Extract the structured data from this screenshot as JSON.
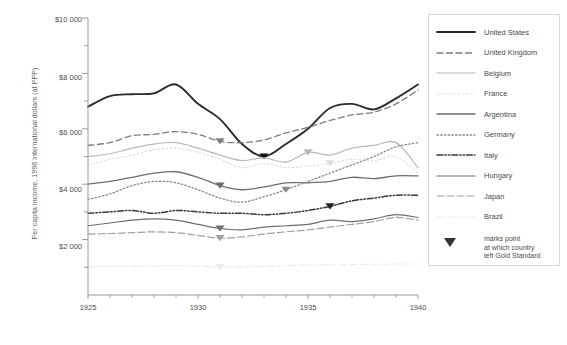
{
  "chart_data": {
    "type": "line",
    "title": "",
    "xlabel": "",
    "ylabel": "Per capita income, 1996 international dollars (at PPP)",
    "xlim": [
      1925,
      1940
    ],
    "ylim": [
      0,
      10000
    ],
    "xticks": [
      "1925",
      "1930",
      "1935",
      "1940"
    ],
    "xtick_values": [
      1925,
      1930,
      1935,
      1940
    ],
    "x_minor_step": 1,
    "yticks": [
      "$2 000",
      "$4 000",
      "$6 000",
      "$8 000",
      "$10 000"
    ],
    "ytick_values": [
      2000,
      4000,
      6000,
      8000,
      10000
    ],
    "y_minor_step": 1000,
    "grid": false,
    "legend_position": "right-outside",
    "x": [
      1925,
      1926,
      1927,
      1928,
      1929,
      1930,
      1931,
      1932,
      1933,
      1934,
      1935,
      1936,
      1937,
      1938,
      1939,
      1940
    ],
    "series": [
      {
        "name": "United States",
        "style": "solid",
        "color": "#2b2b2b",
        "width": 1.9,
        "gold_standard_exit_year": 1933,
        "values": [
          6800,
          7180,
          7250,
          7280,
          7600,
          6900,
          6350,
          5450,
          5000,
          5450,
          6000,
          6750,
          6900,
          6700,
          7100,
          7600
        ]
      },
      {
        "name": "United Kingdom",
        "style": "dashed",
        "color": "#7d7d7d",
        "width": 1.3,
        "gold_standard_exit_year": 1931,
        "values": [
          5400,
          5500,
          5750,
          5800,
          5900,
          5800,
          5550,
          5500,
          5600,
          5850,
          6050,
          6300,
          6500,
          6600,
          6900,
          7400
        ]
      },
      {
        "name": "Belgium",
        "style": "solid",
        "color": "#b9b9b9",
        "width": 1.2,
        "gold_standard_exit_year": 1935,
        "values": [
          5000,
          5100,
          5300,
          5450,
          5500,
          5300,
          5050,
          4850,
          4950,
          4800,
          5150,
          5050,
          5300,
          5400,
          5500,
          4600
        ]
      },
      {
        "name": "France",
        "style": "dotted",
        "color": "#dcdcdc",
        "width": 1.1,
        "gold_standard_exit_year": 1936,
        "values": [
          4700,
          4900,
          5050,
          5250,
          5300,
          5150,
          4900,
          4600,
          4750,
          4600,
          4650,
          4750,
          4900,
          4850,
          5000,
          4400
        ]
      },
      {
        "name": "Argentina",
        "style": "solid",
        "color": "#6e6e6e",
        "width": 1.3,
        "gold_standard_exit_year": 1931,
        "values": [
          4000,
          4100,
          4250,
          4400,
          4450,
          4250,
          3950,
          3800,
          3900,
          4050,
          4050,
          4100,
          4250,
          4200,
          4300,
          4300
        ]
      },
      {
        "name": "Germany",
        "style": "dotted-dense",
        "color": "#8a8a8a",
        "width": 1.3,
        "gold_standard_exit_year": 1934,
        "values": [
          3450,
          3650,
          3950,
          4100,
          4050,
          3800,
          3500,
          3350,
          3550,
          3800,
          4100,
          4400,
          4700,
          5000,
          5350,
          5500
        ]
      },
      {
        "name": "Italy",
        "style": "dash-dot-dot",
        "color": "#3a3a3a",
        "width": 1.5,
        "gold_standard_exit_year": 1936,
        "values": [
          2950,
          3000,
          3050,
          2950,
          3050,
          3000,
          2950,
          2950,
          2900,
          2950,
          3050,
          3200,
          3400,
          3500,
          3600,
          3600
        ]
      },
      {
        "name": "Hungary",
        "style": "solid",
        "color": "#6e6e6e",
        "width": 1.2,
        "gold_standard_exit_year": 1931,
        "values": [
          2500,
          2600,
          2700,
          2750,
          2700,
          2550,
          2400,
          2350,
          2450,
          2500,
          2550,
          2700,
          2650,
          2750,
          2900,
          2800
        ]
      },
      {
        "name": "Japan",
        "style": "long-dash",
        "color": "#a0a0a0",
        "width": 1.2,
        "gold_standard_exit_year": 1931,
        "values": [
          2200,
          2220,
          2250,
          2280,
          2250,
          2150,
          2050,
          2100,
          2200,
          2280,
          2350,
          2450,
          2550,
          2650,
          2800,
          2700
        ]
      },
      {
        "name": "Brazil",
        "style": "long-dash-faint",
        "color": "#ececec",
        "width": 1.1,
        "gold_standard_exit_year": 1931,
        "values": [
          1020,
          1030,
          1040,
          1050,
          1060,
          1040,
          1010,
          1020,
          1040,
          1060,
          1080,
          1090,
          1100,
          1110,
          1120,
          1120
        ]
      }
    ],
    "marker_note": {
      "glyph": "▼",
      "lines": [
        "marks point",
        "at which country",
        "left Gold Standard"
      ]
    }
  },
  "legend": {
    "items": [
      {
        "label": "United States"
      },
      {
        "label": "United Kingdom"
      },
      {
        "label": "Belgium"
      },
      {
        "label": "France"
      },
      {
        "label": "Argentina"
      },
      {
        "label": "Germany"
      },
      {
        "label": "Italy"
      },
      {
        "label": "Hungary"
      },
      {
        "label": "Japan"
      },
      {
        "label": "Brazil"
      }
    ],
    "note_line_1": "marks point",
    "note_line_2": "at which country",
    "note_line_3": "left Gold Standard"
  },
  "axes": {
    "y_title": "Per capita income, 1996 international dollars (at PPP)",
    "y_labels": [
      "$10 000",
      "$8 000",
      "$6 000",
      "$4 000",
      "$2 000"
    ],
    "x_labels": [
      "1925",
      "1930",
      "1935",
      "1940"
    ]
  },
  "colors": {
    "axis": "#9a9a9a",
    "text": "#4a4a4a",
    "background": "#ffffff",
    "marker": "#555555"
  }
}
